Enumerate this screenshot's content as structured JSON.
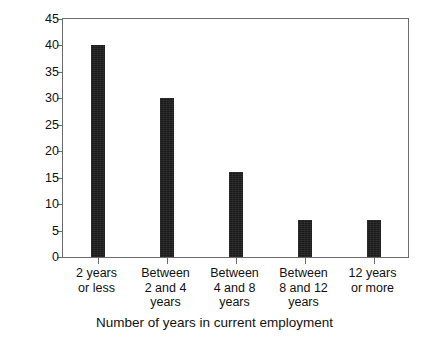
{
  "chart_data": {
    "type": "bar",
    "title": "",
    "subtitle": "",
    "xlabel": "Number of years in current employment",
    "ylabel": "Number of respondents",
    "categories": [
      "2 years\nor less",
      "Between\n2 and 4\nyears",
      "Between\n4 and 8\nyears",
      "Between\n8 and 12\nyears",
      "12 years\nor more"
    ],
    "category_lines": [
      [
        "2 years",
        "or less"
      ],
      [
        "Between",
        "2 and 4",
        "years"
      ],
      [
        "Between",
        "4 and 8",
        "years"
      ],
      [
        "Between",
        "8 and 12",
        "years"
      ],
      [
        "12 years",
        "or more"
      ]
    ],
    "values": [
      40,
      30,
      16,
      7,
      7
    ],
    "ylim": [
      0,
      45
    ],
    "ytick_values": [
      0,
      5,
      10,
      15,
      20,
      25,
      30,
      35,
      40,
      45
    ],
    "ytick_labels": [
      "0",
      "5",
      "10",
      "15",
      "20",
      "25",
      "30",
      "35",
      "40",
      "45"
    ],
    "grid": false,
    "legend": false,
    "legend_position": "none",
    "bar_color": "#1b1b1b",
    "axis_color": "#6b6b6b",
    "background_color": "#ffffff",
    "text_color": "#111111"
  }
}
